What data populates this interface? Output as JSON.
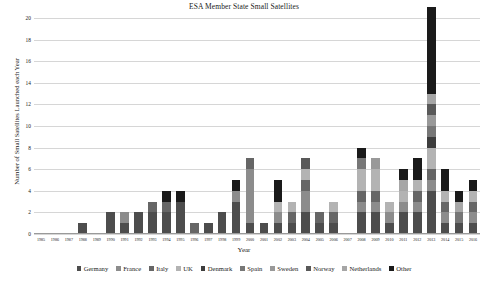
{
  "chart_data": {
    "type": "bar",
    "stacked": true,
    "title": "ESA Member State Small Satellites",
    "xlabel": "Year",
    "ylabel": "Number of Small Satellites Launched each Year",
    "ylim": [
      0,
      20
    ],
    "yticks": [
      0,
      2,
      4,
      6,
      8,
      10,
      12,
      14,
      16,
      18,
      20
    ],
    "grid": true,
    "legend_position": "bottom",
    "categories": [
      "1985",
      "1986",
      "1987",
      "1988",
      "1989",
      "1990",
      "1991",
      "1992",
      "1993",
      "1994",
      "1995",
      "1996",
      "1997",
      "1998",
      "1999",
      "2000",
      "2001",
      "2002",
      "2003",
      "2004",
      "2005",
      "2006",
      "2007",
      "2008",
      "2009",
      "2010",
      "2011",
      "2012",
      "2013",
      "2014",
      "2015",
      "2016"
    ],
    "series": [
      {
        "name": "Germany",
        "color": "#4d4d4d",
        "values": [
          0,
          0,
          0,
          1,
          0,
          2,
          1,
          2,
          2,
          2,
          3,
          0,
          1,
          2,
          3,
          1,
          1,
          1,
          1,
          2,
          1,
          1,
          0,
          2,
          2,
          1,
          2,
          2,
          4,
          1,
          1,
          1
        ]
      },
      {
        "name": "France",
        "color": "#8c8c8c",
        "values": [
          0,
          0,
          0,
          0,
          0,
          0,
          1,
          0,
          0,
          0,
          0,
          0,
          0,
          0,
          1,
          5,
          0,
          1,
          0,
          2,
          0,
          0,
          0,
          1,
          1,
          1,
          1,
          1,
          1,
          1,
          0,
          1
        ]
      },
      {
        "name": "Italy",
        "color": "#666666",
        "values": [
          0,
          0,
          0,
          0,
          0,
          0,
          0,
          0,
          1,
          1,
          0,
          1,
          0,
          0,
          0,
          1,
          0,
          0,
          1,
          1,
          1,
          1,
          0,
          1,
          1,
          0,
          0,
          1,
          1,
          1,
          0,
          1
        ]
      },
      {
        "name": "UK",
        "color": "#b3b3b3",
        "values": [
          0,
          0,
          0,
          0,
          0,
          0,
          0,
          0,
          0,
          0,
          0,
          0,
          0,
          0,
          0,
          0,
          0,
          1,
          1,
          1,
          0,
          1,
          0,
          2,
          2,
          1,
          1,
          1,
          2,
          1,
          0,
          1
        ]
      },
      {
        "name": "Denmark",
        "color": "#3d3d3d",
        "values": [
          0,
          0,
          0,
          0,
          0,
          0,
          0,
          0,
          0,
          0,
          0,
          0,
          0,
          0,
          0,
          0,
          0,
          0,
          0,
          0,
          0,
          0,
          0,
          0,
          0,
          0,
          0,
          0,
          1,
          0,
          0,
          0
        ]
      },
      {
        "name": "Spain",
        "color": "#777777",
        "values": [
          0,
          0,
          0,
          0,
          0,
          0,
          0,
          0,
          0,
          0,
          0,
          0,
          0,
          0,
          0,
          0,
          0,
          0,
          0,
          0,
          0,
          0,
          0,
          1,
          0,
          0,
          0,
          0,
          1,
          0,
          1,
          0
        ]
      },
      {
        "name": "Sweden",
        "color": "#999999",
        "values": [
          0,
          0,
          0,
          0,
          0,
          0,
          0,
          0,
          0,
          0,
          0,
          0,
          0,
          0,
          0,
          0,
          0,
          0,
          0,
          0,
          0,
          0,
          0,
          0,
          1,
          0,
          0,
          0,
          1,
          0,
          0,
          0
        ]
      },
      {
        "name": "Norway",
        "color": "#595959",
        "values": [
          0,
          0,
          0,
          0,
          0,
          0,
          0,
          0,
          0,
          0,
          0,
          0,
          0,
          0,
          0,
          0,
          0,
          0,
          0,
          1,
          0,
          0,
          0,
          0,
          0,
          0,
          0,
          0,
          1,
          0,
          0,
          0
        ]
      },
      {
        "name": "Netherlands",
        "color": "#a6a6a6",
        "values": [
          0,
          0,
          0,
          0,
          0,
          0,
          0,
          0,
          0,
          0,
          0,
          0,
          0,
          0,
          0,
          0,
          0,
          0,
          0,
          0,
          0,
          0,
          0,
          0,
          0,
          0,
          1,
          0,
          1,
          0,
          1,
          0
        ]
      },
      {
        "name": "Other",
        "color": "#1a1a1a",
        "values": [
          0,
          0,
          0,
          0,
          0,
          0,
          0,
          0,
          0,
          1,
          1,
          0,
          0,
          0,
          1,
          0,
          0,
          2,
          0,
          0,
          0,
          0,
          0,
          1,
          0,
          0,
          1,
          2,
          8,
          2,
          1,
          1
        ]
      }
    ],
    "totals": [
      0,
      0,
      0,
      1,
      0,
      2,
      2,
      2,
      3,
      4,
      4,
      1,
      1,
      2,
      5,
      7,
      1,
      5,
      3,
      7,
      2,
      3,
      0,
      8,
      7,
      3,
      6,
      7,
      20,
      6,
      4,
      5
    ]
  }
}
